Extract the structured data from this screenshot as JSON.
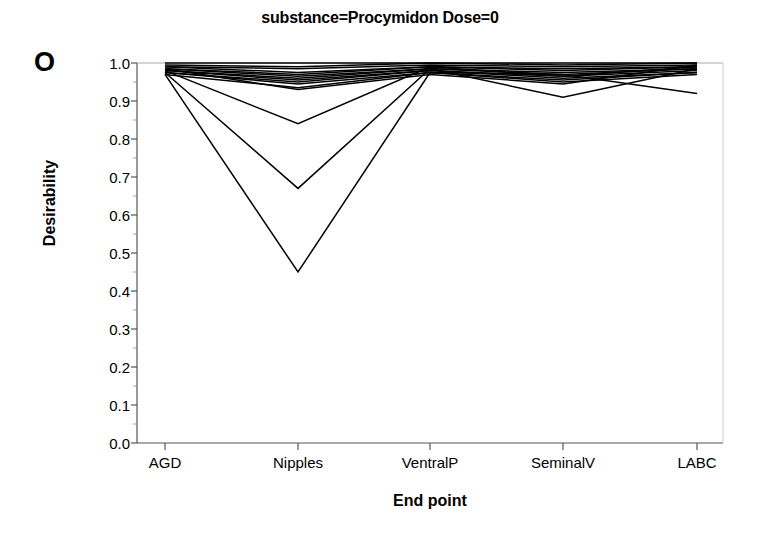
{
  "panel": {
    "letter": "O"
  },
  "chart_data": {
    "type": "line",
    "title": "substance=Procymidon  Dose=0",
    "xlabel": "End point",
    "ylabel": "Desirability",
    "categories": [
      "AGD",
      "Nipples",
      "VentralP",
      "SeminalV",
      "LABC"
    ],
    "ylim": [
      0.0,
      1.0
    ],
    "xtick_labels": [
      "AGD",
      "Nipples",
      "VentralP",
      "SeminalV",
      "LABC"
    ],
    "ytick_labels": [
      "0.0",
      "0.1",
      "0.2",
      "0.3",
      "0.4",
      "0.5",
      "0.6",
      "0.7",
      "0.8",
      "0.9",
      "1.0"
    ],
    "ytick_values": [
      0.0,
      0.1,
      0.2,
      0.3,
      0.4,
      0.5,
      0.6,
      0.7,
      0.8,
      0.9,
      1.0
    ],
    "grid": false,
    "legend": "none",
    "line_color": "#000000",
    "series": [
      {
        "name": "profile-1",
        "values": [
          1.0,
          1.0,
          1.0,
          1.0,
          1.0
        ]
      },
      {
        "name": "profile-2",
        "values": [
          0.995,
          0.99,
          1.0,
          0.995,
          1.0
        ]
      },
      {
        "name": "profile-3",
        "values": [
          0.99,
          0.985,
          0.995,
          0.99,
          0.995
        ]
      },
      {
        "name": "profile-4",
        "values": [
          0.99,
          0.975,
          0.99,
          0.985,
          0.99
        ]
      },
      {
        "name": "profile-5",
        "values": [
          0.985,
          0.97,
          0.99,
          0.98,
          0.99
        ]
      },
      {
        "name": "profile-6",
        "values": [
          0.985,
          0.965,
          0.985,
          0.975,
          0.985
        ]
      },
      {
        "name": "profile-7",
        "values": [
          0.98,
          0.96,
          0.985,
          0.97,
          0.985
        ]
      },
      {
        "name": "profile-8",
        "values": [
          0.98,
          0.955,
          0.98,
          0.965,
          0.98
        ]
      },
      {
        "name": "profile-9",
        "values": [
          0.975,
          0.95,
          0.98,
          0.96,
          0.975
        ]
      },
      {
        "name": "profile-10",
        "values": [
          0.975,
          0.945,
          0.975,
          0.955,
          0.975
        ]
      },
      {
        "name": "profile-11",
        "values": [
          0.97,
          0.935,
          0.975,
          0.95,
          0.97
        ]
      },
      {
        "name": "profile-12",
        "values": [
          0.985,
          0.93,
          0.97,
          0.945,
          0.995
        ]
      },
      {
        "name": "profile-13",
        "values": [
          0.98,
          0.84,
          0.99,
          0.965,
          0.99
        ]
      },
      {
        "name": "profile-14",
        "values": [
          0.975,
          0.67,
          0.985,
          0.91,
          0.985
        ]
      },
      {
        "name": "profile-15",
        "values": [
          0.97,
          0.45,
          0.975,
          0.97,
          0.92
        ]
      }
    ]
  },
  "axes": {
    "x_range_px": [
      137,
      723
    ],
    "y_range_px": [
      443,
      63
    ]
  }
}
